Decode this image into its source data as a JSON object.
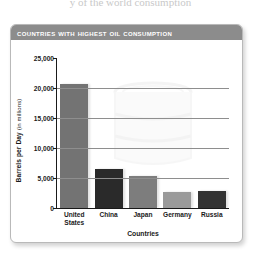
{
  "page": {
    "top_caption": "y of the world consumption"
  },
  "panel": {
    "title": "Countries with Highest Oil Consumption"
  },
  "chart_data": {
    "type": "bar",
    "title": "Countries with Highest Oil Consumption",
    "xlabel": "Countries",
    "ylabel": "Barrels per Day",
    "ylabel_unit": "(in millions)",
    "ylim": [
      0,
      25000
    ],
    "ytick_values": [
      0,
      5000,
      10000,
      15000,
      20000,
      25000
    ],
    "ytick_labels": [
      "0",
      "5,000",
      "10,000",
      "15,000",
      "20,000",
      "25,000"
    ],
    "grid": true,
    "legend": "none",
    "categories": [
      "United States",
      "China",
      "Japan",
      "Germany",
      "Russia"
    ],
    "values": [
      20700,
      6500,
      5400,
      2600,
      2800
    ],
    "bar_colors": [
      "#737373",
      "#2a2a2a",
      "#7d7d7d",
      "#9a9a9a",
      "#333333"
    ]
  },
  "colors": {
    "title_bar": "#8c8c8c",
    "panel_border": "#b9b9b9",
    "axis": "#1a1a1a",
    "gridline": "#8e8e8e",
    "text": "#1a1a1a"
  }
}
